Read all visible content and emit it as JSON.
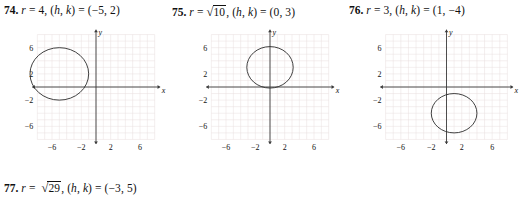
{
  "page": {
    "background": "#ffffff",
    "grid_color": "#e9dede",
    "axis_color": "#3a3a3a",
    "curve_color": "#2b2b2b",
    "text_color": "#111111"
  },
  "problems": [
    {
      "number": "74.",
      "r_label": "r",
      "eq1": "= 4,",
      "radius_value": 4,
      "radius_is_radical": false,
      "radicand": "",
      "center_prefix": "(",
      "h_label": "h",
      "comma": ", ",
      "k_label": "k",
      "center_mid": ") = (",
      "center_values": "−5, 2",
      "center_suffix": ")",
      "h": -5,
      "k": 2,
      "has_graph": true
    },
    {
      "number": "75.",
      "r_label": "r",
      "eq1": "=",
      "radius_value": 3.1622776601683795,
      "radius_is_radical": true,
      "radicand": "10",
      "post_radical": ",",
      "center_prefix": "(",
      "h_label": "h",
      "comma": ", ",
      "k_label": "k",
      "center_mid": ") = (",
      "center_values": "0, 3",
      "center_suffix": ")",
      "h": 0,
      "k": 3,
      "has_graph": true
    },
    {
      "number": "76.",
      "r_label": "r",
      "eq1": "= 3,",
      "radius_value": 3,
      "radius_is_radical": false,
      "radicand": "",
      "center_prefix": "(",
      "h_label": "h",
      "comma": ", ",
      "k_label": "k",
      "center_mid": ") = (",
      "center_values": "1, −4",
      "center_suffix": ")",
      "h": 1,
      "k": -4,
      "has_graph": true
    },
    {
      "number": "77.",
      "r_label": "r",
      "eq1": "=",
      "radius_value": 5.385164807134504,
      "radius_is_radical": true,
      "radicand": "29",
      "post_radical": ",",
      "center_prefix": "(",
      "h_label": "h",
      "comma": ", ",
      "k_label": "k",
      "center_mid": ") = (",
      "center_values": "−3, 5",
      "center_suffix": ")",
      "h": -3,
      "k": 5,
      "has_graph": false
    }
  ],
  "chart_data": [
    {
      "type": "scatter",
      "title": "74",
      "xlabel": "x",
      "ylabel": "y",
      "xlim": [
        -9,
        9
      ],
      "ylim": [
        -9,
        9
      ],
      "xticks": [
        -6,
        -2,
        2,
        6
      ],
      "yticks": [
        -6,
        -2,
        2,
        6
      ],
      "xtick_labels": [
        "−6",
        "−2",
        "2",
        "6"
      ],
      "ytick_labels": [
        "−6",
        "−2",
        "2",
        "6"
      ],
      "grid": true,
      "grid_step": 1,
      "shapes": [
        {
          "shape": "circle",
          "cx": -5,
          "cy": 2,
          "r": 4
        }
      ]
    },
    {
      "type": "scatter",
      "title": "75",
      "xlabel": "x",
      "ylabel": "y",
      "xlim": [
        -9,
        9
      ],
      "ylim": [
        -9,
        9
      ],
      "xticks": [
        -6,
        -2,
        2,
        6
      ],
      "yticks": [
        -6,
        -2,
        2,
        6
      ],
      "xtick_labels": [
        "−6",
        "−2",
        "2",
        "6"
      ],
      "ytick_labels": [
        "−6",
        "−2",
        "2",
        "6"
      ],
      "grid": true,
      "grid_step": 1,
      "shapes": [
        {
          "shape": "circle",
          "cx": 0,
          "cy": 3,
          "r": 3.1622776601683795
        }
      ]
    },
    {
      "type": "scatter",
      "title": "76",
      "xlabel": "x",
      "ylabel": "y",
      "xlim": [
        -9,
        9
      ],
      "ylim": [
        -9,
        9
      ],
      "xticks": [
        -6,
        -2,
        2,
        6
      ],
      "yticks": [
        -6,
        -2,
        2,
        6
      ],
      "xtick_labels": [
        "−6",
        "−2",
        "2",
        "6"
      ],
      "ytick_labels": [
        "−6",
        "−2",
        "2",
        "6"
      ],
      "grid": true,
      "grid_step": 1,
      "shapes": [
        {
          "shape": "circle",
          "cx": 1,
          "cy": -4,
          "r": 3
        }
      ]
    }
  ],
  "axis_labels": {
    "x": "x",
    "y": "y"
  }
}
